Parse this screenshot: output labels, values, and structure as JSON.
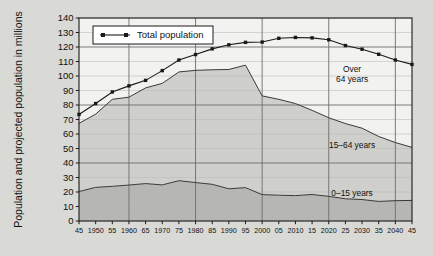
{
  "chart_data": {
    "type": "area",
    "title": "",
    "xlabel": "",
    "ylabel": "Population and projected population in millions",
    "ylim": [
      0,
      140
    ],
    "xlim": [
      1945,
      2045
    ],
    "grid": true,
    "legend_position": "top-left",
    "y_ticks": [
      0,
      10,
      20,
      30,
      40,
      50,
      60,
      70,
      80,
      90,
      100,
      110,
      120,
      130,
      140
    ],
    "y_tick_labels": [
      "0",
      "10",
      "20",
      "30",
      "40",
      "50",
      "60",
      "70",
      "80",
      "90",
      "100",
      "110",
      "120",
      "130",
      "140"
    ],
    "x": [
      1945,
      1950,
      1955,
      1960,
      1965,
      1970,
      1975,
      1980,
      1985,
      1990,
      1995,
      2000,
      2005,
      2010,
      2015,
      2020,
      2025,
      2030,
      2035,
      2040,
      2045
    ],
    "x_tick_labels": [
      "45",
      "1950",
      "55",
      "1960",
      "65",
      "1970",
      "75",
      "1980",
      "85",
      "1990",
      "95",
      "2000",
      "05",
      "2010",
      "15",
      "2020",
      "25",
      "2030",
      "35",
      "2040",
      "45"
    ],
    "x_major_gridlines": [
      1960,
      1980,
      2000,
      2020,
      2040
    ],
    "legend": [
      {
        "name": "Total population",
        "marker": "square",
        "color": "#1a1a1a"
      }
    ],
    "annotations": [
      {
        "text_line1": "Over",
        "text_line2": "64 years",
        "x": 2027,
        "y": 103
      },
      {
        "text_line1": "15–64 years",
        "text_line2": "",
        "x": 2027,
        "y": 53
      },
      {
        "text_line1": "0–15 years",
        "text_line2": "",
        "x": 2027,
        "y": 20
      }
    ],
    "series": [
      {
        "name": "Total population",
        "type": "line-marker",
        "color": "#1a1a1a",
        "values": [
          73.5,
          81.0,
          89.0,
          93.2,
          97.0,
          103.7,
          111.0,
          114.8,
          118.7,
          121.5,
          123.2,
          123.4,
          126.0,
          126.6,
          126.3,
          125.0,
          121.0,
          118.5,
          115.0,
          111.0,
          108.0
        ]
      },
      {
        "name": "0–15 years",
        "type": "band",
        "fill": "#b6b6b2",
        "values": [
          20.3,
          23.2,
          23.9,
          24.8,
          25.8,
          24.9,
          27.8,
          26.5,
          25.3,
          22.2,
          23.0,
          18.2,
          17.8,
          17.5,
          18.3,
          17.0,
          15.3,
          14.8,
          13.5,
          14.0,
          14.2
        ]
      },
      {
        "name": "15–64 years",
        "type": "band",
        "fill": "#cfcfcb",
        "values": [
          47.0,
          50.5,
          60.0,
          60.6,
          66.0,
          70.0,
          75.0,
          77.4,
          79.0,
          82.3,
          84.5,
          68.1,
          66.1,
          63.5,
          58.0,
          54.2,
          51.9,
          49.2,
          44.8,
          40.1,
          36.6
        ]
      },
      {
        "name": "Over 64 years",
        "type": "band",
        "fill": "#f0f0ee",
        "values": [
          6.2,
          7.3,
          5.1,
          7.8,
          5.2,
          8.8,
          8.2,
          10.9,
          14.4,
          17.0,
          15.7,
          37.1,
          42.1,
          45.6,
          50.0,
          53.8,
          53.8,
          54.5,
          56.7,
          56.9,
          57.2
        ]
      }
    ],
    "cumulative_lines": {
      "young_top": [
        20.3,
        23.2,
        23.9,
        24.8,
        25.8,
        24.9,
        27.8,
        26.5,
        25.3,
        22.2,
        23.0,
        18.2,
        17.8,
        17.5,
        18.3,
        17.0,
        15.3,
        14.8,
        13.5,
        14.0,
        14.2
      ],
      "working_top": [
        67.3,
        73.7,
        83.9,
        85.4,
        91.8,
        94.9,
        102.8,
        103.9,
        104.3,
        104.5,
        107.5,
        86.3,
        83.9,
        81.0,
        76.3,
        71.2,
        67.2,
        64.0,
        58.3,
        54.1,
        50.8
      ]
    }
  }
}
